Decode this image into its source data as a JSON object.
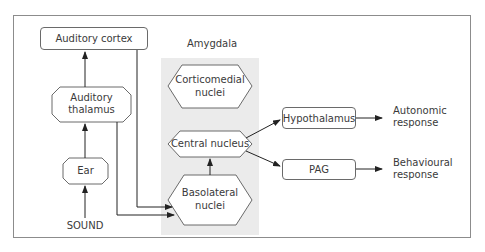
{
  "diagram": {
    "title_region": "Amygdala",
    "nodes": {
      "auditory_cortex": "Auditory cortex",
      "auditory_thalamus_1": "Auditory",
      "auditory_thalamus_2": "thalamus",
      "ear": "Ear",
      "sound": "SOUND",
      "corticomedial_1": "Corticomedial",
      "corticomedial_2": "nuclei",
      "central_nucleus": "Central nucleus",
      "basolateral_1": "Basolateral",
      "basolateral_2": "nuclei",
      "hypothalamus": "Hypothalamus",
      "pag": "PAG"
    },
    "outputs": {
      "autonomic_1": "Autonomic",
      "autonomic_2": "response",
      "behavioural_1": "Behavioural",
      "behavioural_2": "response"
    },
    "colors": {
      "frame": "#8c8c8c",
      "amygdala_region": "#ebebeb",
      "stroke": "#6a6a6a",
      "arrow": "#222222",
      "text": "#3a3a3a"
    }
  }
}
